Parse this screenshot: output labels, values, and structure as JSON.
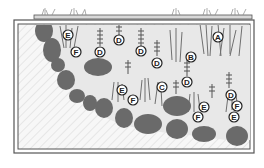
{
  "diagram": {
    "type": "pond-planting-cross-section",
    "colors": {
      "frame": "#555555",
      "rock": "#6a6a6a",
      "water": "#e4e4e4",
      "plant": "#7a7a7a",
      "label_fill": "#ffffff",
      "label_stroke": "#222222"
    },
    "labels": [
      {
        "id": "l1",
        "text": "E",
        "x": 68,
        "y": 35
      },
      {
        "id": "l2",
        "text": "F",
        "x": 76,
        "y": 52
      },
      {
        "id": "l3",
        "text": "D",
        "x": 100,
        "y": 52
      },
      {
        "id": "l4",
        "text": "D",
        "x": 119,
        "y": 40
      },
      {
        "id": "l5",
        "text": "D",
        "x": 141,
        "y": 51
      },
      {
        "id": "l6",
        "text": "D",
        "x": 157,
        "y": 63
      },
      {
        "id": "l7",
        "text": "B",
        "x": 191,
        "y": 57
      },
      {
        "id": "l8",
        "text": "A",
        "x": 218,
        "y": 37
      },
      {
        "id": "l9",
        "text": "D",
        "x": 187,
        "y": 82
      },
      {
        "id": "l10",
        "text": "E",
        "x": 122,
        "y": 90
      },
      {
        "id": "l11",
        "text": "F",
        "x": 133,
        "y": 100
      },
      {
        "id": "l12",
        "text": "C",
        "x": 162,
        "y": 87
      },
      {
        "id": "l13",
        "text": "D",
        "x": 231,
        "y": 95
      },
      {
        "id": "l14",
        "text": "F",
        "x": 237,
        "y": 106
      },
      {
        "id": "l15",
        "text": "E",
        "x": 234,
        "y": 117
      },
      {
        "id": "l16",
        "text": "E",
        "x": 204,
        "y": 107
      },
      {
        "id": "l17",
        "text": "F",
        "x": 198,
        "y": 117
      }
    ]
  }
}
